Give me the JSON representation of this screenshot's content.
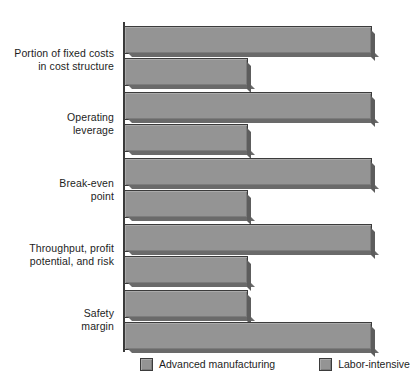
{
  "chart_data": {
    "type": "bar",
    "orientation": "horizontal",
    "title": "",
    "subtitle": "",
    "xlabel": "",
    "ylabel": "",
    "grid": false,
    "axis_ticks_visible": false,
    "legend_position": "bottom",
    "xlim": [
      0,
      100
    ],
    "categories": [
      "Portion of fixed costs\nin cost structure",
      "Operating\nleverage",
      "Break-even\npoint",
      "Throughput, profit\npotential, and risk",
      "Safety\nmargin"
    ],
    "series": [
      {
        "name": "Advanced manufacturing",
        "color": "#949494",
        "values": [
          92,
          92,
          92,
          92,
          46
        ]
      },
      {
        "name": "Labor-intensive",
        "color": "#949494",
        "values": [
          46,
          46,
          46,
          46,
          92
        ]
      }
    ],
    "annotations": [
      "Advanced manufacturing rates high on fixed-cost portion, operating leverage, break-even point, and throughput/profit/risk; labor-intensive rates high on safety margin."
    ]
  },
  "legend": {
    "entries": [
      {
        "label": "Advanced manufacturing",
        "swatch": "#949494"
      },
      {
        "label": "Labor-intensive",
        "swatch": "#949494"
      }
    ]
  },
  "axis": {
    "color": "#3a3a3a"
  },
  "colors": {
    "bar_fill": "#949494",
    "bar_stroke": "#3b3b3b",
    "bar_shadow": "#5d5d5d",
    "text": "#1d1d1d",
    "background": "#ffffff"
  }
}
